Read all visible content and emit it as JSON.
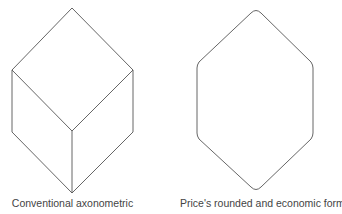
{
  "figures": [
    {
      "name": "conventional-axonometric-cube",
      "caption": "Conventional axonometric",
      "stroke": "#555555"
    },
    {
      "name": "rounded-hexagon",
      "caption": "Price's rounded and economic form",
      "stroke": "#555555"
    }
  ]
}
